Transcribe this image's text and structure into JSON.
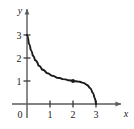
{
  "figure": {
    "background_color": "#ffffff",
    "ink_color": "#1a1a1a",
    "axis_color": "#555555",
    "width": 134,
    "height": 129
  },
  "chart_data": {
    "type": "line",
    "title": "",
    "subtitle": "",
    "xlabel": "x",
    "ylabel": "y",
    "xlim": [
      -0.3,
      4.1
    ],
    "ylim": [
      -0.4,
      3.9
    ],
    "grid": false,
    "legend": null,
    "x_ticks": [
      0,
      1,
      2,
      3
    ],
    "x_tick_labels": [
      "0",
      "1",
      "2",
      "3"
    ],
    "y_ticks": [
      1,
      2,
      3
    ],
    "y_tick_labels": [
      "1",
      "2",
      "3"
    ],
    "origin_label": "0",
    "axis_arrows": [
      "x-positive",
      "y-positive"
    ],
    "series": [
      {
        "name": "curve",
        "style": "solid",
        "color": "#1a1a1a",
        "x": [
          0.0,
          0.08,
          0.16,
          0.25,
          0.35,
          0.5,
          0.65,
          0.85,
          1.05,
          1.3,
          1.55,
          1.8,
          2.0,
          2.2,
          2.4,
          2.58,
          2.72,
          2.84,
          2.93,
          3.0
        ],
        "y": [
          3.0,
          2.62,
          2.35,
          2.1,
          1.9,
          1.67,
          1.5,
          1.35,
          1.24,
          1.14,
          1.08,
          1.03,
          1.0,
          0.98,
          0.93,
          0.84,
          0.7,
          0.5,
          0.28,
          0.0
        ]
      }
    ],
    "points": [
      {
        "name": "plateau-point",
        "x": 2,
        "y": 1,
        "marker": "dot",
        "color": "#1a1a1a",
        "label": ""
      }
    ],
    "annotations": []
  },
  "labels": {
    "x_axis": "x",
    "y_axis": "y",
    "zero": "0",
    "x1": "1",
    "x2": "2",
    "x3": "3",
    "y1": "1",
    "y2": "2",
    "y3": "3"
  }
}
